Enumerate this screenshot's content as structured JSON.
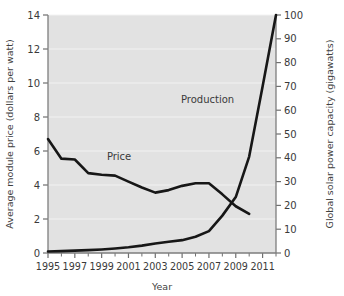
{
  "chart_data": {
    "type": "line",
    "title": "",
    "xlabel": "Year",
    "ylabel": "Average module price (dollars per watt)",
    "y2label": "Global solar power capacity (gigawatts)",
    "grid": true,
    "legend": "inline-annotations",
    "xlim": [
      1995,
      2012
    ],
    "ylim": [
      0,
      14
    ],
    "y2lim": [
      0,
      100
    ],
    "xticks": [
      1995,
      1997,
      1999,
      2001,
      2003,
      2005,
      2007,
      2009,
      2011
    ],
    "xticks_minor": [
      1996,
      1998,
      2000,
      2002,
      2004,
      2006,
      2008,
      2010,
      2012
    ],
    "xtick_labels": [
      "1995",
      "1997",
      "1999",
      "2001",
      "2003",
      "2005",
      "2007",
      "2009",
      "2011"
    ],
    "yticks": [
      0,
      2,
      4,
      6,
      8,
      10,
      12,
      14
    ],
    "ytick_labels": [
      "0",
      "2",
      "4",
      "6",
      "8",
      "10",
      "12",
      "14"
    ],
    "y2ticks": [
      0,
      10,
      20,
      30,
      40,
      50,
      60,
      70,
      80,
      90,
      100
    ],
    "y2tick_labels": [
      "0",
      "10",
      "20",
      "30",
      "40",
      "50",
      "60",
      "70",
      "80",
      "90",
      "100"
    ],
    "series": [
      {
        "name": "Price",
        "axis": "left",
        "units": "dollars per watt",
        "annotation": "Price",
        "annotation_x": 2000.3,
        "annotation_y": 5.45,
        "x": [
          1995,
          1996,
          1997,
          1998,
          1999,
          2000,
          2001,
          2002,
          2003,
          2004,
          2005,
          2006,
          2007,
          2008,
          2009,
          2010
        ],
        "values": [
          6.7,
          5.55,
          5.5,
          4.7,
          4.6,
          4.55,
          4.2,
          3.85,
          3.55,
          3.7,
          3.95,
          4.1,
          4.1,
          3.45,
          2.75,
          2.3
        ]
      },
      {
        "name": "Production",
        "axis": "right",
        "units": "gigawatts",
        "annotation": "Production",
        "annotation_x": 2006.9,
        "annotation_y": 63,
        "x": [
          1995,
          1996,
          1997,
          1998,
          1999,
          2000,
          2001,
          2002,
          2003,
          2004,
          2005,
          2006,
          2007,
          2008,
          2009,
          2010,
          2011,
          2012
        ],
        "values": [
          0.6,
          0.8,
          1.0,
          1.2,
          1.5,
          1.9,
          2.4,
          3.1,
          4.0,
          4.7,
          5.4,
          6.8,
          9.2,
          15.7,
          23.5,
          40.5,
          70.0,
          100.0
        ]
      }
    ]
  }
}
